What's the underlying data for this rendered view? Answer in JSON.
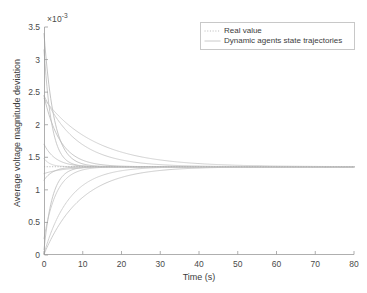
{
  "figure": {
    "background_color": "#ffffff",
    "axis_color": "#9a9a9a",
    "text_color": "#3c3c3c"
  },
  "y_exponent": {
    "mantissa": "×10",
    "power": "-3"
  },
  "legend": {
    "entries": [
      {
        "label": "Real value",
        "color": "#b8b8b8",
        "style": "dotted",
        "icon": "dotted-line-swatch-icon"
      },
      {
        "label": "Dynamic agents state trajectories",
        "color": "#c4c4c4",
        "style": "solid",
        "icon": "solid-line-swatch-icon"
      }
    ]
  },
  "chart_data": {
    "type": "line",
    "title": "",
    "subtitle": "",
    "xlabel": "Time (s)",
    "ylabel": "Average voltage magnitude deviation",
    "xlim": [
      0,
      80
    ],
    "ylim": [
      0,
      0.0035
    ],
    "y_scale_exponent": -3,
    "xticks": [
      0,
      10,
      20,
      30,
      40,
      50,
      60,
      70,
      80
    ],
    "xticklabels": [
      "0",
      "10",
      "20",
      "30",
      "40",
      "50",
      "60",
      "70",
      "80"
    ],
    "yticks": [
      0,
      0.0005,
      0.001,
      0.0015,
      0.002,
      0.0025,
      0.003,
      0.0035
    ],
    "yticklabels": [
      "0",
      "0.5",
      "1",
      "1.5",
      "2",
      "2.5",
      "3",
      "3.5"
    ],
    "grid": false,
    "tick_direction": "in",
    "box": false,
    "legend_position": "upper right",
    "consensus_value": 0.001355,
    "real_value_series": {
      "name": "Real value",
      "color": "#b0b0b0",
      "style": "dotted",
      "width": 0.9,
      "constant": 0.001355
    },
    "series": [
      {
        "name": "agent-1",
        "color": "#b9b9b9",
        "y0": 0.0034,
        "tau": 2.6,
        "yinf": 0.001355
      },
      {
        "name": "agent-2",
        "color": "#c0c0c0",
        "y0": 0.00315,
        "tau": 2.0,
        "yinf": 0.001355
      },
      {
        "name": "agent-3",
        "color": "#c6c6c6",
        "y0": 0.00245,
        "tau": 8.5,
        "yinf": 0.001355
      },
      {
        "name": "agent-4",
        "color": "#bdbdbd",
        "y0": 0.00244,
        "tau": 4.2,
        "yinf": 0.001355
      },
      {
        "name": "agent-5",
        "color": "#c9c9c9",
        "y0": 0.0024,
        "tau": 13.0,
        "yinf": 0.001355
      },
      {
        "name": "agent-6",
        "color": "#c2c2c2",
        "y0": 0.0017,
        "tau": 3.0,
        "yinf": 0.001355
      },
      {
        "name": "agent-7",
        "color": "#cfcfcf",
        "y0": 0.00148,
        "tau": 1.6,
        "yinf": 0.001355
      },
      {
        "name": "agent-8",
        "color": "#c5c5c5",
        "y0": 0.00125,
        "tau": 5.5,
        "yinf": 0.001355
      },
      {
        "name": "agent-9",
        "color": "#bcbcbc",
        "y0": 0.00115,
        "tau": 2.4,
        "yinf": 0.001355
      },
      {
        "name": "agent-10",
        "color": "#c8c8c8",
        "y0": 0.00025,
        "tau": 3.2,
        "yinf": 0.001355
      },
      {
        "name": "agent-11",
        "color": "#bfbfbf",
        "y0": 8e-05,
        "tau": 2.2,
        "yinf": 0.001355
      },
      {
        "name": "agent-12",
        "color": "#cacaca",
        "y0": 2e-05,
        "tau": 6.5,
        "yinf": 0.001355
      },
      {
        "name": "agent-13",
        "color": "#c3c3c3",
        "y0": 1e-05,
        "tau": 9.5,
        "yinf": 0.001355
      }
    ]
  }
}
